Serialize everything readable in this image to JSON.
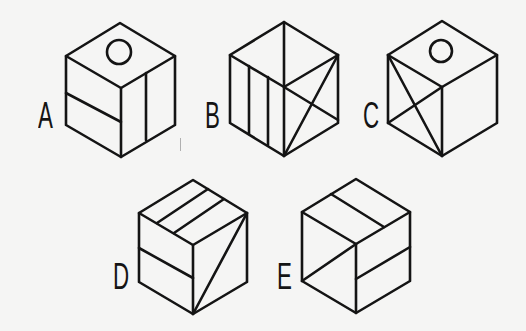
{
  "figure": {
    "type": "cube-pattern-choices",
    "background_color": "#f5f5f4",
    "line_color": "#141414",
    "options": [
      {
        "label": "A",
        "label_pos": [
          38,
          98
        ],
        "vertices": {
          "top": [
            120,
            23
          ],
          "ul": [
            66,
            56
          ],
          "ur": [
            175,
            56
          ],
          "center": [
            121,
            88
          ],
          "ll": [
            66,
            125
          ],
          "lr": [
            175,
            125
          ],
          "bottom": [
            121,
            157
          ]
        },
        "top_face": "circle",
        "left_face": "horizontal line",
        "right_face": "vertical line"
      },
      {
        "label": "B",
        "label_pos": [
          205,
          98
        ],
        "vertices": {
          "top": [
            284,
            22
          ],
          "ul": [
            230,
            55
          ],
          "ur": [
            338,
            55
          ],
          "center": [
            284,
            87
          ],
          "ll": [
            230,
            123
          ],
          "lr": [
            338,
            123
          ],
          "bottom": [
            284,
            156
          ]
        },
        "top_face": "vertical line",
        "left_face": "two vertical lines",
        "right_face": "X (two diagonals)"
      },
      {
        "label": "C",
        "label_pos": [
          363,
          98
        ],
        "vertices": {
          "top": [
            442,
            21
          ],
          "ul": [
            388,
            55
          ],
          "ur": [
            497,
            55
          ],
          "center": [
            442,
            87
          ],
          "ll": [
            388,
            123
          ],
          "lr": [
            497,
            123
          ],
          "bottom": [
            442,
            156
          ]
        },
        "top_face": "circle",
        "left_face": "X (two diagonals)",
        "right_face": "blank"
      },
      {
        "label": "D",
        "label_pos": [
          113,
          259
        ],
        "vertices": {
          "top": [
            193,
            180
          ],
          "ul": [
            139,
            213
          ],
          "ur": [
            247,
            213
          ],
          "center": [
            193,
            245
          ],
          "ll": [
            139,
            282
          ],
          "lr": [
            247,
            282
          ],
          "bottom": [
            193,
            314
          ]
        },
        "top_face": "two parallel lines",
        "left_face": "horizontal line",
        "right_face": "diagonal line"
      },
      {
        "label": "E",
        "label_pos": [
          277,
          259
        ],
        "vertices": {
          "top": [
            356,
            179
          ],
          "ul": [
            302,
            212
          ],
          "ur": [
            410,
            212
          ],
          "center": [
            356,
            244
          ],
          "ll": [
            302,
            281
          ],
          "lr": [
            410,
            281
          ],
          "bottom": [
            356,
            313
          ]
        },
        "top_face": "one line",
        "left_face": "diagonal line",
        "right_face": "horizontal line"
      }
    ]
  }
}
